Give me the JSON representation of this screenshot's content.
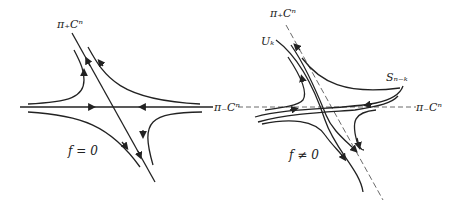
{
  "figure": {
    "panels": [
      {
        "id": "left",
        "caption": "f = 0",
        "labels": {
          "unstable_axis": "π₊Cⁿ",
          "stable_axis": "π₋Cⁿ"
        }
      },
      {
        "id": "right",
        "caption": "f ≠ 0",
        "labels": {
          "unstable_axis": "π₊Cⁿ",
          "stable_axis": "π₋Cⁿ",
          "unstable_manifold": "Uₖ",
          "stable_manifold": "Sₙ₋ₖ"
        }
      }
    ]
  }
}
